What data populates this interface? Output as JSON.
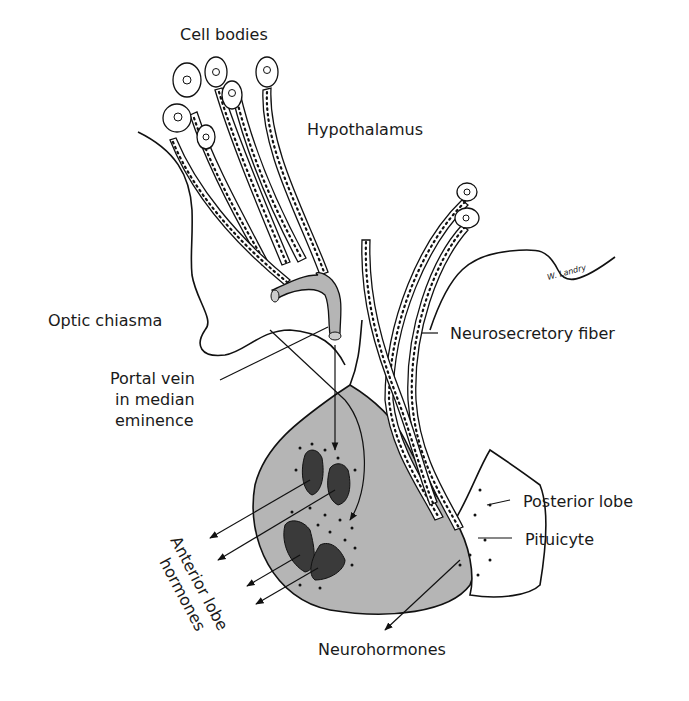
{
  "diagram": {
    "type": "anatomical-illustration",
    "colors": {
      "line": "#111111",
      "anterior_lobe_fill": "#b5b5b5",
      "cell_dark": "#3a3a3a",
      "background": "#ffffff"
    },
    "labels": {
      "cell_bodies": "Cell bodies",
      "hypothalamus": "Hypothalamus",
      "optic_chiasma": "Optic chiasma",
      "portal_vein_line1": "Portal vein",
      "portal_vein_line2": "in median",
      "portal_vein_line3": "eminence",
      "neurosecretory_fiber": "Neurosecretory fiber",
      "posterior_lobe": "Posterior lobe",
      "pituicyte": "Pituicyte",
      "anterior_lobe_hormones_line1": "Anterior lobe",
      "anterior_lobe_hormones_line2": "hormones",
      "neurohormones": "Neurohormones"
    },
    "signature": "W. Landry"
  }
}
